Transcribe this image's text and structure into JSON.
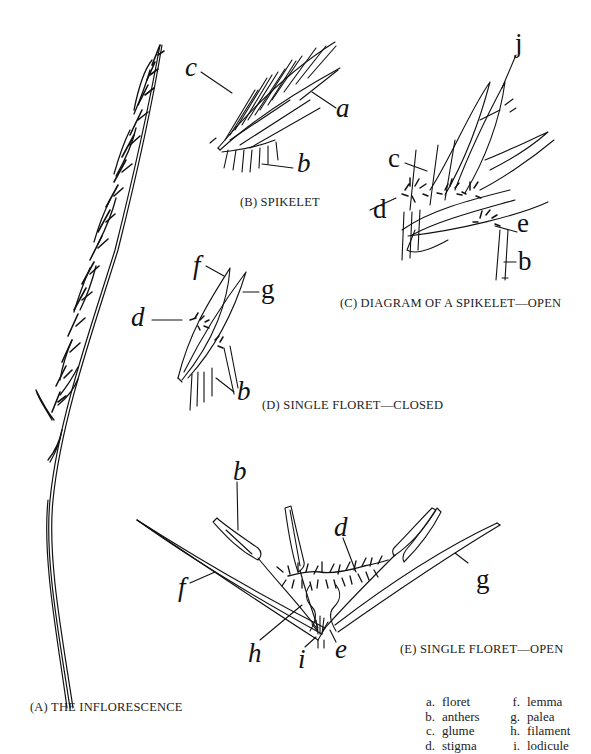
{
  "figure": {
    "panels": [
      {
        "id": "A",
        "caption": "(A) THE INFLORESCENCE"
      },
      {
        "id": "B",
        "caption": "(B) SPIKELET"
      },
      {
        "id": "C",
        "caption": "(C) DIAGRAM OF A SPIKELET—OPEN"
      },
      {
        "id": "D",
        "caption": "(D) SINGLE FLORET—CLOSED"
      },
      {
        "id": "E",
        "caption": "(E) SINGLE FLORET—OPEN"
      }
    ],
    "labels": {
      "B": {
        "a": "a",
        "b": "b",
        "c": "c"
      },
      "C": {
        "c": "c",
        "d": "d",
        "e": "e",
        "b": "b",
        "j": "j"
      },
      "D": {
        "f": "f",
        "g": "g",
        "d": "d",
        "b": "b"
      },
      "E": {
        "b": "b",
        "d": "d",
        "f": "f",
        "g": "g",
        "h": "h",
        "i": "i",
        "e": "e"
      }
    },
    "legend": {
      "left": [
        {
          "key": "a.",
          "term": "floret"
        },
        {
          "key": "b.",
          "term": "anthers"
        },
        {
          "key": "c.",
          "term": "glume"
        },
        {
          "key": "d.",
          "term": "stigma"
        }
      ],
      "right": [
        {
          "key": "f.",
          "term": "lemma"
        },
        {
          "key": "g.",
          "term": "palea"
        },
        {
          "key": "h.",
          "term": "filament"
        },
        {
          "key": "i.",
          "term": "lodicule"
        }
      ]
    },
    "colors": {
      "ink": "#111111",
      "background": "#ffffff"
    }
  }
}
